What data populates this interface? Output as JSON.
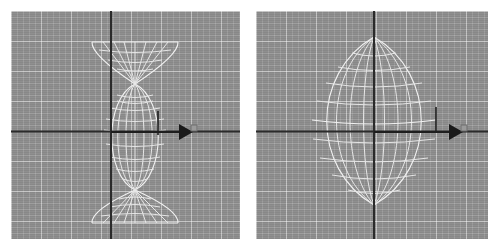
{
  "scene": {
    "app_kind": "3d-modeling-viewport",
    "background_color": "#ffffff",
    "viewport_color": "#8d8d8d",
    "grid_minor_color": "#ffffff",
    "grid_major_color": "#ffffff",
    "wireframe_color": "#f2f2f2",
    "axis_color": "#2b2b2b",
    "gizmo_color": "#1a1a1a",
    "panel_count": 2
  },
  "panels": [
    {
      "id": "left",
      "name": "viewport-left",
      "caption": "",
      "grid": {
        "minor_spacing_px": 6,
        "major_spacing_px": 30,
        "visible": true
      },
      "axes": {
        "horizontal_y_px": 120,
        "vertical_x_px": 100,
        "horizontal_visible": true,
        "vertical_visible": true
      },
      "object": {
        "type": "revolved-spindle-with-cones",
        "center_x_px": 124,
        "center_y_px": 121,
        "half_width_px": 31,
        "body_top_y_px": 73,
        "body_bottom_y_px": 179,
        "cone_top_y_px": 31,
        "cone_bottom_y_px": 212,
        "cone_half_width_px": 43,
        "meridian_count": 8,
        "latitude_count": 9
      },
      "gizmo": {
        "type": "translate-arrow-x",
        "start_x_px": 100,
        "tip_x_px": 181,
        "y_px": 121,
        "tick_x_px": 147,
        "tick_top_y_px": 100,
        "tick_bottom_y_px": 124,
        "handle_visible": true
      }
    },
    {
      "id": "right",
      "name": "viewport-right",
      "caption": "",
      "grid": {
        "minor_spacing_px": 6,
        "major_spacing_px": 30,
        "visible": true
      },
      "axes": {
        "horizontal_y_px": 120,
        "vertical_x_px": 118,
        "horizontal_visible": true,
        "vertical_visible": true
      },
      "object": {
        "type": "revolved-spindle",
        "center_x_px": 118,
        "center_y_px": 121,
        "half_width_px": 63,
        "apex_top_y_px": 26,
        "apex_bottom_y_px": 194,
        "meridian_count": 8,
        "latitude_count": 9
      },
      "gizmo": {
        "type": "translate-arrow-x",
        "start_x_px": 118,
        "tip_x_px": 206,
        "y_px": 121,
        "tick_x_px": 180,
        "tick_top_y_px": 96,
        "tick_bottom_y_px": 122,
        "handle_visible": true
      }
    }
  ]
}
